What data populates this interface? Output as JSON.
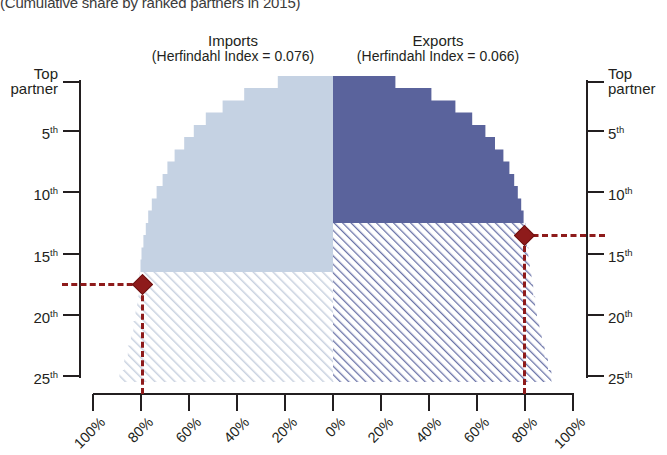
{
  "title": "(Cumulative share by ranked partners in 2015)",
  "panels": {
    "left": {
      "name": "Imports",
      "index_label": "(Herfindahl Index = 0.076)",
      "herfindahl_index": 0.076,
      "fill_color": "#c5d2e3",
      "hatch_color": "#cfd6e2"
    },
    "right": {
      "name": "Exports",
      "index_label": "(Herfindahl Index = 0.066)",
      "herfindahl_index": 0.066,
      "fill_color": "#5a639c",
      "hatch_color": "#8f97bd"
    }
  },
  "axes": {
    "y_left_labels": [
      "Top partner",
      "5th",
      "10th",
      "15th",
      "20th",
      "25th"
    ],
    "y_right_labels": [
      "Top partner",
      "5th",
      "10th",
      "15th",
      "20th",
      "25th"
    ],
    "y_ranks": [
      1,
      5,
      10,
      15,
      20,
      25
    ],
    "x_labels_left": [
      "100%",
      "80%",
      "60%",
      "40%",
      "20%",
      "0%"
    ],
    "x_labels_right": [
      "20%",
      "40%",
      "60%",
      "80%",
      "100%"
    ],
    "x_values_left": [
      100,
      80,
      60,
      40,
      20,
      0
    ],
    "x_values_right": [
      20,
      40,
      60,
      80,
      100
    ]
  },
  "markers": {
    "left": {
      "rank_label": "17th",
      "share_label": "80%",
      "rank": 17,
      "share": 80,
      "color": "#8e1b1b"
    },
    "right": {
      "rank_label": "13th",
      "share_label": "80%",
      "rank": 13,
      "share": 80,
      "color": "#8e1b1b"
    }
  },
  "chart_data": {
    "type": "area",
    "title": "(Cumulative share by ranked partners in 2015)",
    "subtitle": "",
    "xlabel": "",
    "ylabel": "",
    "orientation": "horizontal-mirrored-cumulative",
    "xlim": [
      100,
      100
    ],
    "ylim": [
      1,
      26
    ],
    "grid": false,
    "legend_position": "top",
    "annotation_left": "Imports (Herfindahl Index = 0.076)",
    "annotation_right": "Exports (Herfindahl Index = 0.066)",
    "categories": [
      "1",
      "2",
      "3",
      "4",
      "5",
      "6",
      "7",
      "8",
      "9",
      "10",
      "11",
      "12",
      "13",
      "14",
      "15",
      "16",
      "17",
      "18",
      "19",
      "20",
      "21",
      "22",
      "23",
      "24",
      "25"
    ],
    "series": [
      {
        "name": "Imports",
        "direction": "left",
        "unit": "% cumulative share",
        "values": [
          23,
          37,
          46,
          53,
          58,
          62,
          66,
          69,
          71,
          73.5,
          75.5,
          77,
          78,
          79,
          79.8,
          80.2,
          80.6,
          81,
          81.6,
          82.3,
          83.2,
          84.2,
          85.5,
          87,
          89
        ]
      },
      {
        "name": "Exports",
        "direction": "right",
        "unit": "% cumulative share",
        "values": [
          26,
          41,
          51,
          58,
          63.5,
          67.5,
          71,
          73.5,
          75.5,
          77,
          78.4,
          79.4,
          80.2,
          80.8,
          81.4,
          82,
          82.7,
          83.4,
          84.2,
          85,
          86,
          87,
          88.2,
          89.6,
          91
        ]
      }
    ],
    "highlight_points": [
      {
        "series": "Imports",
        "rank": 17,
        "share": 80
      },
      {
        "series": "Exports",
        "rank": 13,
        "share": 80
      }
    ]
  }
}
